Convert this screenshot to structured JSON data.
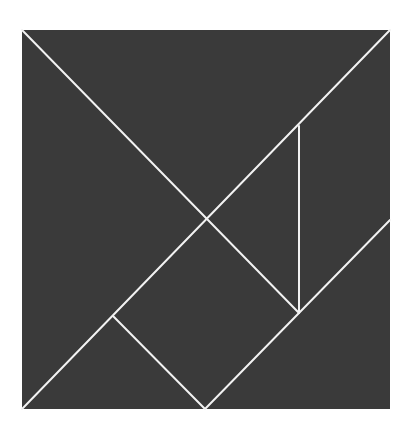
{
  "diagram": {
    "type": "tangram",
    "canvas": {
      "width": 411,
      "height": 428
    },
    "colors": {
      "background": "#ffffff",
      "fill": "#3a3a3a",
      "line": "#f2f2f2"
    },
    "square": {
      "x1": 22,
      "y1": 30,
      "x2": 390,
      "y2": 409
    },
    "lines": [
      {
        "id": "diag-main-tl-to-br",
        "x1": 22,
        "y1": 30,
        "x2": 299,
        "y2": 313
      },
      {
        "id": "diag-main-bl-to-tr",
        "x1": 22,
        "y1": 409,
        "x2": 390,
        "y2": 30
      },
      {
        "id": "vertical-parallelogram-edge",
        "x1": 299,
        "y1": 126,
        "x2": 299,
        "y2": 313
      },
      {
        "id": "right-edge-to-bottom-center",
        "x1": 390,
        "y1": 220,
        "x2": 205,
        "y2": 409
      },
      {
        "id": "small-triangle-edge",
        "x1": 113,
        "y1": 316,
        "x2": 205,
        "y2": 409
      }
    ],
    "pieces": [
      {
        "name": "large-triangle-top",
        "points": "22,30 390,30 207,219"
      },
      {
        "name": "large-triangle-left",
        "points": "22,30 207,219 22,409"
      },
      {
        "name": "parallelogram-right",
        "points": "299,126 390,30 390,220 299,313"
      },
      {
        "name": "small-triangle-center",
        "points": "207,219 299,126 299,313"
      },
      {
        "name": "square-center",
        "points": "207,219 299,313 205,409 113,316"
      },
      {
        "name": "small-triangle-bottom-left",
        "points": "113,316 205,409 22,409"
      },
      {
        "name": "medium-triangle-bottom-right",
        "points": "390,220 390,409 205,409"
      }
    ]
  }
}
